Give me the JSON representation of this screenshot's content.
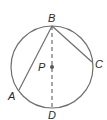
{
  "diagram": {
    "type": "circle-geometry",
    "circle": {
      "center": "P",
      "cx": 52,
      "cy": 67,
      "r": 41,
      "stroke": "#6e6e6e"
    },
    "points": {
      "A": {
        "label": "A",
        "x": 19,
        "y": 90
      },
      "B": {
        "label": "B",
        "x": 52,
        "y": 26
      },
      "C": {
        "label": "C",
        "x": 92,
        "y": 62
      },
      "D": {
        "label": "D",
        "x": 52,
        "y": 108
      },
      "P": {
        "label": "P",
        "x": 52,
        "y": 67
      }
    },
    "segments": [
      {
        "from": "B",
        "to": "A",
        "style": "solid"
      },
      {
        "from": "B",
        "to": "C",
        "style": "solid"
      },
      {
        "from": "B",
        "to": "D",
        "style": "dashed"
      }
    ],
    "line_color": "#6e6e6e",
    "label_color": "#2a2a2a"
  }
}
